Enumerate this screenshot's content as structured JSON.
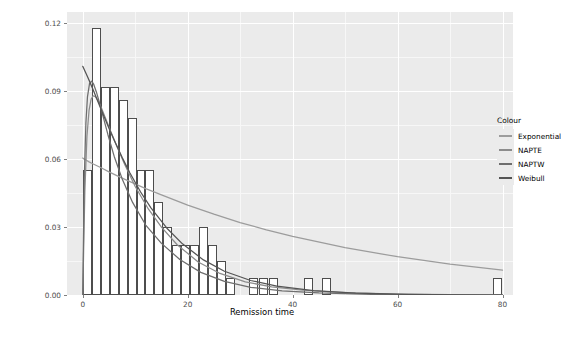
{
  "chart_data": {
    "type": "histogram",
    "title": "",
    "subtitle": "",
    "xlabel": "Remission time",
    "ylabel": "",
    "xlim": [
      -3,
      82
    ],
    "ylim": [
      0,
      0.125
    ],
    "grid": true,
    "legend_position": "right",
    "x_ticks": [
      0,
      20,
      40,
      60,
      80
    ],
    "x_tick_labels": [
      "0",
      "20",
      "40",
      "60",
      "80"
    ],
    "y_ticks": [
      0.0,
      0.03,
      0.06,
      0.09,
      0.12
    ],
    "y_tick_labels": [
      "0.00",
      "0.03",
      "0.06",
      "0.09",
      "0.12"
    ],
    "x_minor_ticks": [
      10,
      30,
      50,
      70
    ],
    "y_minor_ticks": [
      0.015,
      0.045,
      0.075,
      0.105
    ],
    "bar_width": 1.7,
    "bar_fill": "#ffffff",
    "bar_outline": "#4d4d4d",
    "panel_background": "#ebebeb",
    "histogram": {
      "x_centers": [
        0.9,
        2.6,
        4.3,
        6.0,
        7.7,
        9.4,
        11.1,
        12.8,
        14.5,
        16.2,
        17.9,
        19.6,
        21.3,
        23.0,
        24.7,
        26.4,
        28.1,
        32.5,
        34.4,
        36.3,
        43.0,
        46.5,
        79.0
      ],
      "densities": [
        0.055,
        0.118,
        0.092,
        0.092,
        0.086,
        0.078,
        0.055,
        0.055,
        0.041,
        0.03,
        0.022,
        0.022,
        0.022,
        0.03,
        0.022,
        0.015,
        0.0075,
        0.0075,
        0.0075,
        0.0075,
        0.0075,
        0.0075,
        0.0075
      ]
    },
    "series": [
      {
        "name": "Exponential",
        "colour": "#9c9c9c",
        "x": [
          0.0,
          0.3,
          0.7,
          1.2,
          1.8,
          2.5,
          3.5,
          5.0,
          7.0,
          9.0,
          12.0,
          15.0,
          20.0,
          25.0,
          30.0,
          35.0,
          40.0,
          50.0,
          60.0,
          70.0,
          80.0
        ],
        "y": [
          0.0605,
          0.06,
          0.0595,
          0.0588,
          0.0581,
          0.0573,
          0.0562,
          0.0544,
          0.0522,
          0.0501,
          0.047,
          0.0442,
          0.0397,
          0.0357,
          0.032,
          0.0288,
          0.0259,
          0.0209,
          0.0169,
          0.0136,
          0.011
        ]
      },
      {
        "name": "NAPTE",
        "colour": "#8c8c8c",
        "x": [
          0.0,
          0.4,
          0.8,
          1.2,
          1.6,
          2.0,
          2.4,
          3.0,
          3.6,
          4.4,
          5.2,
          6.5,
          8.0,
          10.0,
          12.5,
          15.0,
          18.0,
          22.0,
          26.0,
          31.0,
          36.0,
          42.0,
          50.0,
          60.0,
          70.0,
          80.0
        ],
        "y": [
          0.0,
          0.0455,
          0.07,
          0.0815,
          0.0865,
          0.088,
          0.0876,
          0.0855,
          0.0824,
          0.0778,
          0.073,
          0.0657,
          0.0576,
          0.0479,
          0.038,
          0.03,
          0.0222,
          0.0146,
          0.0097,
          0.0058,
          0.0036,
          0.0021,
          0.001,
          0.0004,
          0.0002,
          0.0001
        ]
      },
      {
        "name": "NAPTW",
        "colour": "#6e6e6e",
        "x": [
          0.0,
          0.3,
          0.6,
          0.9,
          1.3,
          1.7,
          2.1,
          2.6,
          3.2,
          3.9,
          4.8,
          6.0,
          7.5,
          9.5,
          12.0,
          15.0,
          18.5,
          22.5,
          27.0,
          32.0,
          38.0,
          45.0,
          55.0,
          65.0,
          80.0
        ],
        "y": [
          0.0,
          0.052,
          0.076,
          0.0875,
          0.0935,
          0.0945,
          0.093,
          0.0897,
          0.0848,
          0.0787,
          0.0708,
          0.0612,
          0.0514,
          0.0409,
          0.0309,
          0.0228,
          0.0157,
          0.01,
          0.006,
          0.0034,
          0.0018,
          0.0009,
          0.0003,
          0.0001,
          0.0
        ]
      },
      {
        "name": "Weibull",
        "colour": "#545454",
        "x": [
          0.0,
          1.0,
          2.0,
          3.0,
          4.0,
          5.0,
          6.0,
          7.5,
          9.0,
          11.0,
          13.0,
          16.0,
          19.0,
          23.0,
          27.0,
          32.0,
          37.0,
          44.0,
          52.0,
          62.0,
          72.0,
          80.0
        ],
        "y": [
          0.101,
          0.096,
          0.0905,
          0.0848,
          0.0792,
          0.0737,
          0.0684,
          0.0608,
          0.0539,
          0.0456,
          0.0385,
          0.0296,
          0.0226,
          0.0155,
          0.0105,
          0.0064,
          0.0039,
          0.0019,
          0.0008,
          0.0003,
          0.0001,
          0.0
        ]
      }
    ]
  },
  "legend": {
    "title": "Colour",
    "items": [
      {
        "label": "Exponential",
        "colour": "#9c9c9c"
      },
      {
        "label": "NAPTE",
        "colour": "#8c8c8c"
      },
      {
        "label": "NAPTW",
        "colour": "#6e6e6e"
      },
      {
        "label": "Weibull",
        "colour": "#545454"
      }
    ]
  }
}
